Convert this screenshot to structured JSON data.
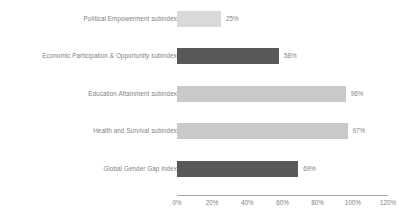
{
  "chart_data": {
    "type": "bar",
    "orientation": "horizontal",
    "title": "",
    "subtitle": "",
    "xlabel": "",
    "ylabel": "",
    "xlim": [
      0,
      120
    ],
    "grid": false,
    "legend": false,
    "categories": [
      "Political Empowerment subindex",
      "Economic Participation & Opportunity subindex",
      "Education Attainment subindex",
      "Health and Survival subindex",
      "Global Gender Gap Index"
    ],
    "values": [
      25,
      58,
      96,
      97,
      69
    ],
    "data_labels": [
      "25%",
      "58%",
      "96%",
      "97%",
      "69%"
    ],
    "bar_colors": [
      "#d9d9d9",
      "#595959",
      "#c9c9c9",
      "#c9c9c9",
      "#595959"
    ],
    "xticks": [
      0,
      20,
      40,
      60,
      80,
      100,
      120
    ],
    "xtick_labels": [
      "0%",
      "20%",
      "40%",
      "60%",
      "80%",
      "100%",
      "120%"
    ],
    "axis_color": "#a6a6a6",
    "text_color": "#7f7f7f",
    "background": "#ffffff"
  }
}
